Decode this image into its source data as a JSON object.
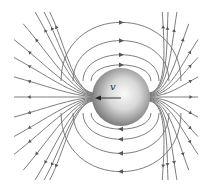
{
  "diagram": {
    "title": "",
    "sphere": {
      "cx": 121,
      "cy": 97,
      "r": 29,
      "label": ""
    },
    "velocity": {
      "label": "v",
      "direction": "left",
      "from": [
        121,
        98
      ],
      "to": [
        96,
        98
      ]
    },
    "colors": {
      "line": "#6e6e6e",
      "sphere_light": "#f4f4f4",
      "sphere_dark": "#7a7a7a",
      "arrow": "#333333"
    },
    "loops": {
      "count_top": 4,
      "count_bottom": 4,
      "top_arrow_direction": "right",
      "bottom_arrow_direction": "left"
    },
    "fans": {
      "left_lines": 15,
      "right_lines": 15,
      "arrow_direction": "outward"
    }
  }
}
